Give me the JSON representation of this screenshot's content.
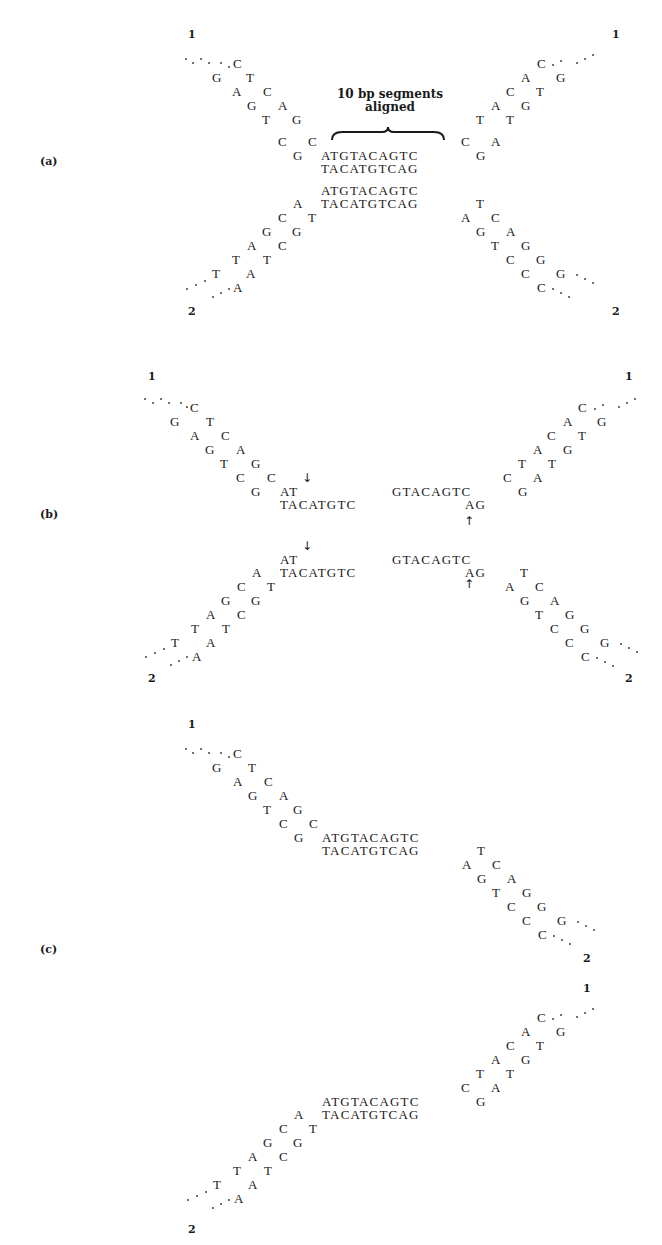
{
  "figure": {
    "panels": [
      {
        "label": "(a)",
        "annotation": {
          "line1": "10 bp segments",
          "line2": "aligned"
        },
        "strand_ends": {
          "top_left": "1",
          "top_right": "1",
          "bottom_left": "2",
          "bottom_right": "2"
        },
        "duplex_top": {
          "top": "ATGTACAGTC",
          "bottom": "TACATGTCAG"
        },
        "duplex_bottom": {
          "top": "ATGTACAGTC",
          "bottom": "TACATGTCAG"
        }
      },
      {
        "label": "(b)",
        "strand_ends": {
          "top_left": "1",
          "top_right": "1",
          "bottom_left": "2",
          "bottom_right": "2"
        },
        "duplex_top": {
          "left_top": "AT",
          "left_bottom": "TACATGTC",
          "right_top": "GTACAGTC",
          "right_bottom": "AG"
        },
        "duplex_bottom": {
          "left_top": "AT",
          "left_bottom": "TACATGTC",
          "right_top": "GTACAGTC",
          "right_bottom": "AG"
        },
        "arrows": {
          "down": "↓",
          "up": "↑"
        }
      },
      {
        "label": "(c)",
        "strand_ends": {
          "top_left": "1",
          "right_mid": "2",
          "right_top": "1",
          "bottom_left": "2"
        },
        "duplex_top": {
          "top": "ATGTACAGTC",
          "bottom": "TACATGTCAG"
        },
        "duplex_bottom": {
          "top": "ATGTACAGTC",
          "bottom": "TACATGTCAG"
        }
      }
    ],
    "arms": {
      "upper_left": [
        [
          "C"
        ],
        [
          "G",
          "T"
        ],
        [
          "A",
          "C"
        ],
        [
          "G",
          "A"
        ],
        [
          "T",
          "G"
        ],
        [
          "C",
          "C"
        ],
        [
          "G"
        ]
      ],
      "upper_right": [
        [
          "C"
        ],
        [
          "A",
          "G"
        ],
        [
          "C",
          "T"
        ],
        [
          "A",
          "G"
        ],
        [
          "T",
          "T"
        ],
        [
          "C",
          "A"
        ],
        [
          "G"
        ]
      ],
      "lower_left": [
        [
          "A"
        ],
        [
          "C",
          "T"
        ],
        [
          "G",
          "G"
        ],
        [
          "A",
          "C"
        ],
        [
          "T",
          "T"
        ],
        [
          "T",
          "A"
        ],
        [
          "A"
        ]
      ],
      "lower_right": [
        [
          "T"
        ],
        [
          "A",
          "C"
        ],
        [
          "G",
          "A"
        ],
        [
          "T",
          "G"
        ],
        [
          "C",
          "G"
        ],
        [
          "C",
          "G"
        ],
        [
          "C"
        ]
      ]
    }
  }
}
